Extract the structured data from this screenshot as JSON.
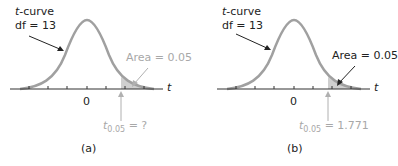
{
  "panels": [
    {
      "id": "a",
      "curve_label": "t-curve",
      "curve_label_italic": "t",
      "curve_label_rest": "-curve",
      "df_label": "df = 13",
      "area_label": "Area = 0.05",
      "area_label_color": "#a8a8a8",
      "axis_var": "t",
      "zero_tick": "0",
      "critical_symbol": "t",
      "critical_subscript": "0.05",
      "critical_value_text": " = ?",
      "critical_color": "#a8a8a8",
      "caption": "(a)"
    },
    {
      "id": "b",
      "curve_label": "t-curve",
      "curve_label_italic": "t",
      "curve_label_rest": "-curve",
      "df_label": "df = 13",
      "area_label": "Area = 0.05",
      "area_label_color": "#222222",
      "axis_var": "t",
      "zero_tick": "0",
      "critical_symbol": "t",
      "critical_subscript": "0.05",
      "critical_value_text": " = 1.771",
      "critical_color": "#a8a8a8",
      "caption": "(b)"
    }
  ],
  "colors": {
    "curve": "#a0a0a0",
    "axis": "#333333",
    "arrow": "#222222",
    "shaded_area": "#b0b0b0"
  }
}
